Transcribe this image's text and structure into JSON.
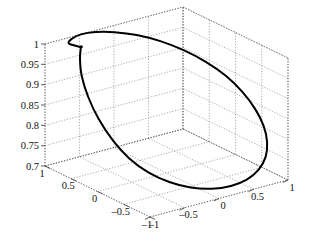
{
  "figure": {
    "title": "",
    "background_color": "#ffffff",
    "curve_color": "#000000",
    "grid_color": "#8a8a8a",
    "axis_color": "#555555"
  },
  "chart_data": {
    "type": "line",
    "projection": "3d",
    "title": "",
    "xlabel": "",
    "ylabel": "",
    "zlabel": "",
    "xlim": [
      -1,
      1
    ],
    "ylim": [
      -1,
      1
    ],
    "zlim": [
      0.7,
      1
    ],
    "grid": true,
    "legend": null,
    "xticks": [
      -1,
      -0.5,
      0,
      0.5,
      1
    ],
    "xticklabels": [
      "-1",
      "-0.5",
      "0",
      "0.5",
      "1"
    ],
    "yticks": [
      -1,
      -0.5,
      0,
      0.5,
      1
    ],
    "yticklabels": [
      "-1",
      "-0.5",
      "0",
      "0.5",
      "1"
    ],
    "zticks": [
      0.7,
      0.75,
      0.8,
      0.85,
      0.9,
      0.95,
      1
    ],
    "zticklabels": [
      "0.7",
      "0.75",
      "0.8",
      "0.85",
      "0.9",
      "0.95",
      "1"
    ],
    "series": [
      {
        "name": "space curve",
        "description": "closed self-intersecting 3D space curve, figure-eight-like",
        "x": [
          -0.7,
          -0.82,
          -0.93,
          -0.99,
          -1.0,
          -0.96,
          -0.87,
          -0.72,
          -0.53,
          -0.31,
          -0.07,
          0.18,
          0.41,
          0.62,
          0.79,
          0.91,
          0.98,
          1.0,
          0.97,
          0.89,
          0.76,
          0.59,
          0.39,
          0.17,
          -0.06,
          -0.28,
          -0.48,
          -0.64,
          -0.76,
          -0.7
        ],
        "y": [
          0.71,
          0.57,
          0.39,
          0.19,
          -0.02,
          -0.23,
          -0.43,
          -0.6,
          -0.75,
          -0.87,
          -0.95,
          -0.99,
          -0.99,
          -0.94,
          -0.85,
          -0.72,
          -0.56,
          -0.37,
          -0.17,
          0.04,
          0.25,
          0.45,
          0.63,
          0.79,
          0.91,
          0.98,
          1.0,
          0.96,
          0.86,
          0.71
        ],
        "z": [
          0.997,
          0.982,
          0.955,
          0.92,
          0.88,
          0.84,
          0.803,
          0.772,
          0.749,
          0.733,
          0.724,
          0.722,
          0.727,
          0.739,
          0.757,
          0.78,
          0.807,
          0.836,
          0.866,
          0.896,
          0.923,
          0.947,
          0.967,
          0.982,
          0.992,
          0.998,
          1.0,
          0.999,
          0.999,
          0.997
        ]
      }
    ]
  },
  "axes": {
    "z_ticks": [
      "1",
      "0.95",
      "0.9",
      "0.85",
      "0.8",
      "0.75",
      "0.7"
    ],
    "y_ticks": [
      "1",
      "0.5",
      "0",
      "-0.5",
      "-1"
    ],
    "x_ticks": [
      "-1",
      "-0.5",
      "0",
      "0.5",
      "1"
    ]
  }
}
